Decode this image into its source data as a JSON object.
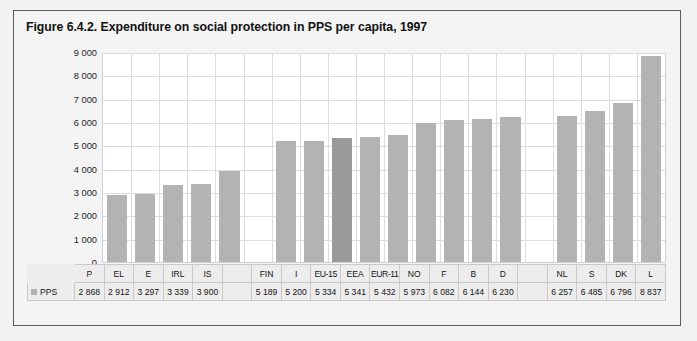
{
  "figure": {
    "title": "Figure 6.4.2. Expenditure on social protection in PPS per capita, 1997",
    "legend_label": "PPS",
    "legend_swatch_color": "#b3b3b3",
    "bar_color": "#b3b3b3",
    "highlight_bar_color": "#9a9a9a",
    "plot_background": "#ffffff",
    "grid_color": "#dcdcdc",
    "frame_background": "#f4f4f4",
    "frame_border_color": "#5b5b5b"
  },
  "chart_data": {
    "type": "bar",
    "title": "Figure 6.4.2. Expenditure on social protection in PPS per capita, 1997",
    "xlabel": "",
    "ylabel": "",
    "ylim": [
      0,
      9000
    ],
    "ytick_labels": [
      "9 000",
      "8 000",
      "7 000",
      "6 000",
      "5 000",
      "4 000",
      "3 000",
      "2 000",
      "1 000",
      "0"
    ],
    "yticks": [
      9000,
      8000,
      7000,
      6000,
      5000,
      4000,
      3000,
      2000,
      1000,
      0
    ],
    "grid": true,
    "legend": [
      "PPS"
    ],
    "legend_position": "table-row-left",
    "series_name": "PPS",
    "highlight_category": "EU-15",
    "categories": [
      "P",
      "EL",
      "E",
      "IRL",
      "IS",
      "",
      "FIN",
      "I",
      "EU-15",
      "EEA",
      "EUR-11",
      "NO",
      "F",
      "B",
      "D",
      "",
      "NL",
      "S",
      "DK",
      "L"
    ],
    "values": [
      2868,
      2912,
      3297,
      3339,
      3900,
      null,
      5189,
      5200,
      5334,
      5341,
      5432,
      5973,
      6082,
      6144,
      6230,
      null,
      6257,
      6485,
      6796,
      8837
    ],
    "value_labels": [
      "2 868",
      "2 912",
      "3 297",
      "3 339",
      "3 900",
      "",
      "5 189",
      "5 200",
      "5 334",
      "5 341",
      "5 432",
      "5 973",
      "6 082",
      "6 144",
      "6 230",
      "",
      "6 257",
      "6 485",
      "6 796",
      "8 837"
    ]
  }
}
